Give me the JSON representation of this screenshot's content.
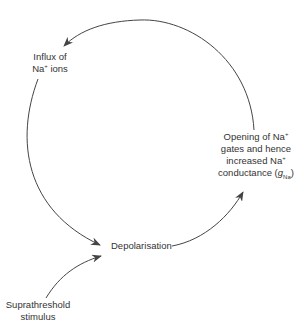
{
  "diagram": {
    "type": "cycle",
    "nodes": {
      "influx": {
        "line1": "Influx of",
        "line2_main": "Na",
        "line2_sup": "+",
        "line2_rest": " ions"
      },
      "opening": {
        "line1_main": "Opening of Na",
        "line1_sup": "+",
        "line2": "gates and hence",
        "line3_main": "increased Na",
        "line3_sup": "+",
        "line4_main": "conductance (",
        "line4_g": "g",
        "line4_sub": "Na",
        "line4_end": ")"
      },
      "depolarisation": {
        "label": "Depolarisation"
      },
      "stimulus": {
        "line1": "Suprathreshold",
        "line2": "stimulus"
      }
    },
    "edges": [
      {
        "from": "Opening of Na+ gates and hence increased Na+ conductance (gNa)",
        "to": "Influx of Na+ ions"
      },
      {
        "from": "Influx of Na+ ions",
        "to": "Depolarisation"
      },
      {
        "from": "Depolarisation",
        "to": "Opening of Na+ gates and hence increased Na+ conductance (gNa)"
      },
      {
        "from": "Suprathreshold stimulus",
        "to": "Depolarisation"
      }
    ],
    "colors": {
      "line": "#444444",
      "text": "#333333",
      "background": "#ffffff"
    }
  }
}
